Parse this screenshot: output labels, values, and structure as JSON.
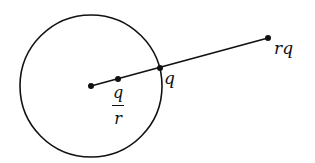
{
  "diagram": {
    "circle": {
      "cx": 91,
      "cy": 86,
      "r": 71
    },
    "points": [
      {
        "name": "center",
        "x": 91,
        "y": 86
      },
      {
        "name": "q_over_r",
        "x": 118,
        "y": 79
      },
      {
        "name": "q",
        "x": 160,
        "y": 68
      },
      {
        "name": "rq",
        "x": 268,
        "y": 38
      }
    ],
    "labels": {
      "q": "q",
      "rq": "rq",
      "frac_num": "q",
      "frac_den": "r"
    },
    "stroke_color": "#111111"
  }
}
